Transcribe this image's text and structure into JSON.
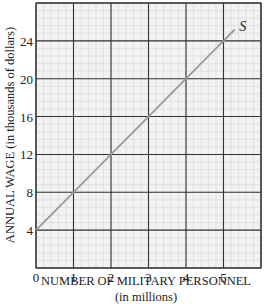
{
  "chart_data": {
    "type": "line",
    "title": "",
    "xlabel": "NUMBER OF MILITARY PERSONNEL",
    "xlabel_sub": "(in millions)",
    "ylabel": "ANNUAL WAGE (in thousands of dollars)",
    "xlim": [
      0,
      6
    ],
    "ylim": [
      0,
      28
    ],
    "x_ticks": [
      0,
      1,
      2,
      3,
      4,
      5
    ],
    "y_ticks": [
      4,
      8,
      12,
      16,
      20,
      24
    ],
    "grid": {
      "major": true,
      "minor": true,
      "minor_divisions": 5
    },
    "series": [
      {
        "name": "S",
        "label": "S",
        "color": "#9a9a9a",
        "x": [
          0,
          1,
          2,
          3,
          4,
          5,
          5.3
        ],
        "y": [
          4,
          8,
          12,
          16,
          20,
          24,
          25.2
        ]
      }
    ],
    "legend": "inline label at line end"
  },
  "colors": {
    "background": "#f2f2f2",
    "major_grid": "#333333",
    "minor_grid": "#dcdcdc",
    "line": "#9a9a9a"
  }
}
